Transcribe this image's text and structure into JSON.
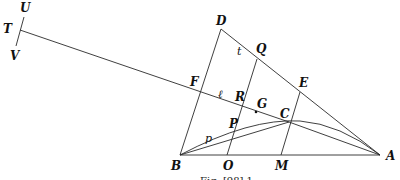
{
  "figure": {
    "caption": "Fig. [98] 1",
    "points": {
      "A": {
        "label": "A",
        "x": 380,
        "y": 155
      },
      "B": {
        "label": "B",
        "x": 180,
        "y": 155
      },
      "C": {
        "label": "C",
        "x": 289,
        "y": 122
      },
      "D": {
        "label": "D",
        "x": 221,
        "y": 29
      },
      "E": {
        "label": "E",
        "x": 300,
        "y": 92
      },
      "F": {
        "label": "F",
        "x": 201,
        "y": 92
      },
      "G": {
        "label": "G",
        "x": 254,
        "y": 111
      },
      "M": {
        "label": "M",
        "x": 281,
        "y": 155
      },
      "O": {
        "label": "O",
        "x": 227,
        "y": 155
      },
      "P": {
        "label": "P",
        "x": 233,
        "y": 130
      },
      "Q": {
        "label": "Q",
        "x": 257,
        "y": 59
      },
      "R": {
        "label": "R",
        "x": 241,
        "y": 104
      },
      "T": {
        "label": "T",
        "x": 20,
        "y": 30
      },
      "U": {
        "label": "U",
        "x": 23,
        "y": 18
      },
      "V": {
        "label": "V",
        "x": 16,
        "y": 45
      }
    },
    "small_labels": {
      "t": "t",
      "l": "ℓ",
      "p": "p"
    }
  }
}
